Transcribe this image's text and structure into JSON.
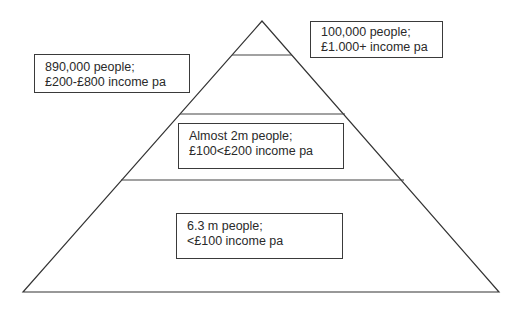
{
  "diagram": {
    "type": "income-pyramid",
    "tiers": [
      {
        "level": 1,
        "position": "top",
        "people": "100,000 people;",
        "income": "£1.000+ income pa"
      },
      {
        "level": 2,
        "position": "upper-middle",
        "people": "890,000 people;",
        "income": "£200-£800 income pa"
      },
      {
        "level": 3,
        "position": "lower-middle",
        "people": "Almost 2m people;",
        "income": "£100<£200 income pa"
      },
      {
        "level": 4,
        "position": "base",
        "people": "6.3 m people;",
        "income": "<£100 income pa"
      }
    ],
    "colors": {
      "line": "#333333",
      "text": "#2a2a2a",
      "background": "#ffffff"
    }
  }
}
